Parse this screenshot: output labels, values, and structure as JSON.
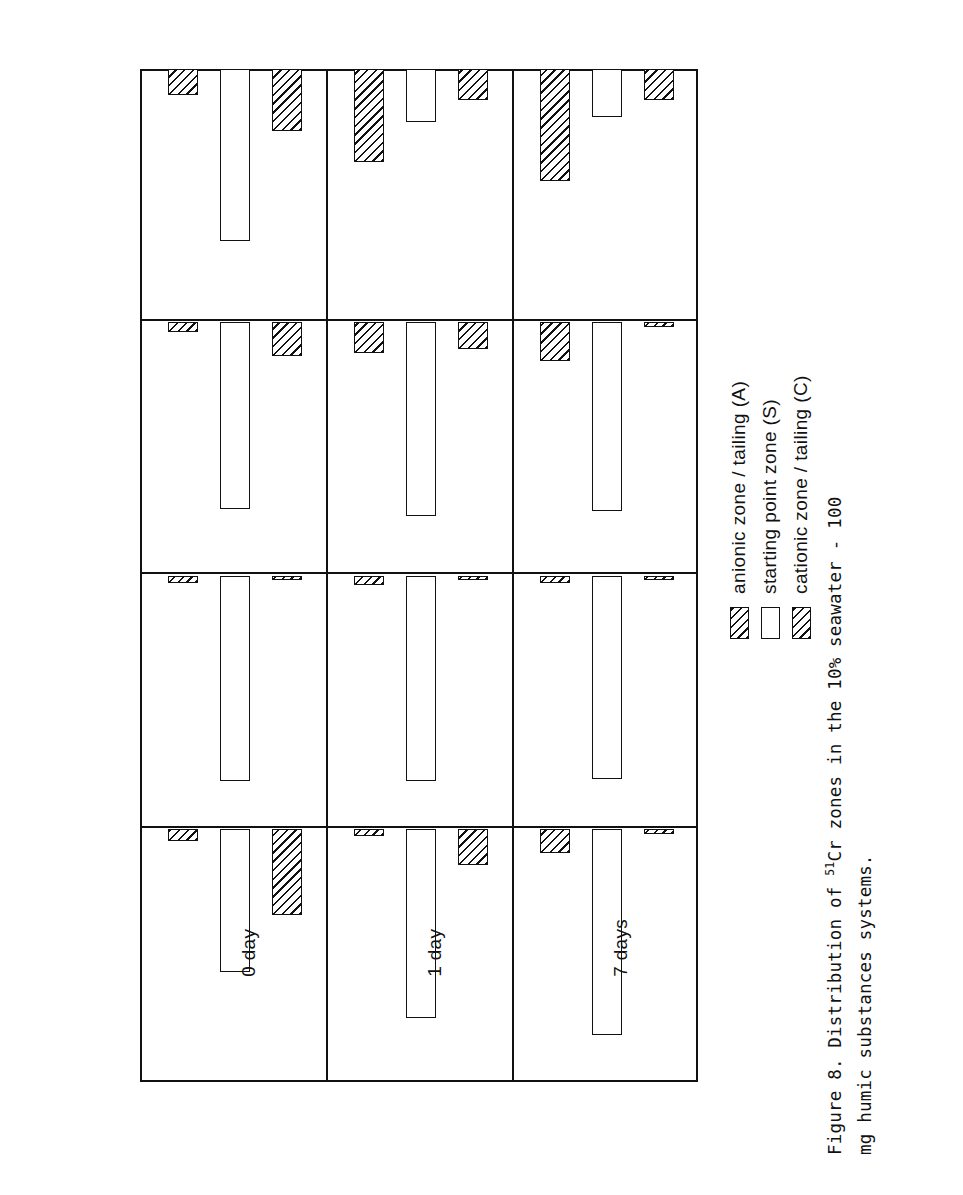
{
  "figure": {
    "caption_line1_pre": "Figure 8.  Distribution of ",
    "caption_sup": "51",
    "caption_line1_post": "Cr zones in the 10% seawater - 100",
    "caption_line2": "mg humic substances systems."
  },
  "legend": {
    "items": [
      {
        "swatch": "hatched",
        "label": "anionic zone / tailing (A)"
      },
      {
        "swatch": "open",
        "label": "starting point zone (S)"
      },
      {
        "swatch": "hatched",
        "label": "cationic zone / tailing (C)"
      }
    ]
  },
  "axis": {
    "unit_label": "°/°°",
    "isotope_label_sup": "51",
    "isotope_label": "Cr",
    "ticks": [
      100,
      80,
      60,
      40,
      20,
      0
    ],
    "range": [
      0,
      100
    ]
  },
  "panels": [
    {
      "time_label": "0 day"
    },
    {
      "time_label": "1 day"
    },
    {
      "time_label": "7 days"
    }
  ],
  "categories": [
    {
      "label": "10°/° seawater",
      "sub": "(S = 3.7 °/°°)"
    },
    {
      "label": "HAM (Mahakam)",
      "sub": ""
    },
    {
      "label": "HAC (Canet)",
      "sub": ""
    },
    {
      "label": "FAC (Canet)",
      "sub": ""
    }
  ],
  "chart_data": {
    "type": "bar",
    "title": "Distribution of 51Cr zones in the 10% seawater - 100 mg humic substances systems",
    "xlabel": "",
    "ylabel": "% 51Cr",
    "ylim": [
      0,
      100
    ],
    "grid": false,
    "legend_position": "top-left",
    "orientation": "horizontal",
    "categories": [
      "10% seawater (S=3.7 o/oo)",
      "HAM (Mahakam)",
      "HAC (Canet)",
      "FAC (Canet)"
    ],
    "zones": [
      "anionic zone / tailing (A)",
      "starting point zone (S)",
      "cationic zone / tailing (C)"
    ],
    "panels": [
      {
        "name": "0 day",
        "series": [
          {
            "name": "anionic zone / tailing (A)",
            "values": [
              5,
              3,
              4,
              11
            ]
          },
          {
            "name": "starting point zone (S)",
            "values": [
              60,
              86,
              78,
              72
            ]
          },
          {
            "name": "cationic zone / tailing (C)",
            "values": [
              36,
              2,
              14,
              26
            ]
          }
        ]
      },
      {
        "name": "1 day",
        "series": [
          {
            "name": "anionic zone / tailing (A)",
            "values": [
              3,
              4,
              13,
              39
            ]
          },
          {
            "name": "starting point zone (S)",
            "values": [
              79,
              86,
              81,
              22
            ]
          },
          {
            "name": "cationic zone / tailing (C)",
            "values": [
              15,
              2,
              11,
              13
            ]
          }
        ]
      },
      {
        "name": "7 days",
        "series": [
          {
            "name": "anionic zone / tailing (A)",
            "values": [
              10,
              3,
              16,
              47
            ]
          },
          {
            "name": "starting point zone (S)",
            "values": [
              86,
              85,
              79,
              20
            ]
          },
          {
            "name": "cationic zone / tailing (C)",
            "values": [
              2,
              2,
              2,
              13
            ]
          }
        ]
      }
    ]
  }
}
